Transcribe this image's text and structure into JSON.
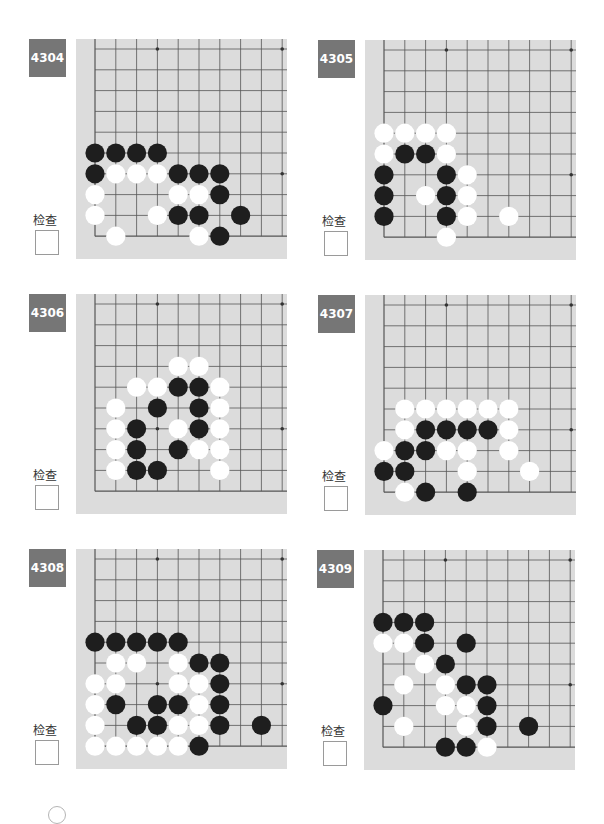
{
  "check_label": "检查",
  "colors": {
    "badge": "#767676",
    "board": "#dcdcdc",
    "line": "#555555",
    "black": "#1e1e1e",
    "white": "#ffffff"
  },
  "problems": [
    {
      "id": "4304",
      "label": "4304",
      "pos": [
        29,
        39
      ],
      "star_points": [
        [
          3,
          0
        ],
        [
          9,
          0
        ],
        [
          9,
          6
        ]
      ],
      "stones": [
        [
          0,
          5,
          "B"
        ],
        [
          1,
          5,
          "B"
        ],
        [
          2,
          5,
          "B"
        ],
        [
          3,
          5,
          "B"
        ],
        [
          0,
          6,
          "B"
        ],
        [
          1,
          6,
          "W"
        ],
        [
          2,
          6,
          "W"
        ],
        [
          3,
          6,
          "W"
        ],
        [
          4,
          6,
          "B"
        ],
        [
          5,
          6,
          "B"
        ],
        [
          6,
          6,
          "B"
        ],
        [
          0,
          7,
          "W"
        ],
        [
          4,
          7,
          "W"
        ],
        [
          5,
          7,
          "W"
        ],
        [
          6,
          7,
          "B"
        ],
        [
          0,
          8,
          "W"
        ],
        [
          3,
          8,
          "W"
        ],
        [
          4,
          8,
          "B"
        ],
        [
          5,
          8,
          "B"
        ],
        [
          7,
          8,
          "B"
        ],
        [
          1,
          9,
          "W"
        ],
        [
          5,
          9,
          "W"
        ],
        [
          6,
          9,
          "B"
        ]
      ]
    },
    {
      "id": "4305",
      "label": "4305",
      "pos": [
        318,
        40
      ],
      "star_points": [
        [
          3,
          0
        ],
        [
          9,
          0
        ],
        [
          9,
          6
        ]
      ],
      "stones": [
        [
          0,
          4,
          "W"
        ],
        [
          1,
          4,
          "W"
        ],
        [
          2,
          4,
          "W"
        ],
        [
          3,
          4,
          "W"
        ],
        [
          0,
          5,
          "W"
        ],
        [
          1,
          5,
          "B"
        ],
        [
          2,
          5,
          "B"
        ],
        [
          3,
          5,
          "W"
        ],
        [
          0,
          6,
          "B"
        ],
        [
          3,
          6,
          "B"
        ],
        [
          4,
          6,
          "W"
        ],
        [
          0,
          7,
          "B"
        ],
        [
          2,
          7,
          "W"
        ],
        [
          3,
          7,
          "B"
        ],
        [
          4,
          7,
          "W"
        ],
        [
          0,
          8,
          "B"
        ],
        [
          3,
          8,
          "B"
        ],
        [
          4,
          8,
          "W"
        ],
        [
          6,
          8,
          "W"
        ],
        [
          3,
          9,
          "W"
        ]
      ]
    },
    {
      "id": "4306",
      "label": "4306",
      "pos": [
        29,
        294
      ],
      "star_points": [
        [
          3,
          0
        ],
        [
          9,
          0
        ],
        [
          3,
          6
        ],
        [
          9,
          6
        ]
      ],
      "stones": [
        [
          4,
          3,
          "W"
        ],
        [
          5,
          3,
          "W"
        ],
        [
          2,
          4,
          "W"
        ],
        [
          3,
          4,
          "W"
        ],
        [
          4,
          4,
          "B"
        ],
        [
          5,
          4,
          "B"
        ],
        [
          6,
          4,
          "W"
        ],
        [
          1,
          5,
          "W"
        ],
        [
          3,
          5,
          "B"
        ],
        [
          5,
          5,
          "B"
        ],
        [
          6,
          5,
          "W"
        ],
        [
          1,
          6,
          "W"
        ],
        [
          2,
          6,
          "B"
        ],
        [
          4,
          6,
          "W"
        ],
        [
          5,
          6,
          "B"
        ],
        [
          6,
          6,
          "W"
        ],
        [
          1,
          7,
          "W"
        ],
        [
          2,
          7,
          "B"
        ],
        [
          4,
          7,
          "B"
        ],
        [
          5,
          7,
          "W"
        ],
        [
          6,
          7,
          "W"
        ],
        [
          1,
          8,
          "W"
        ],
        [
          2,
          8,
          "B"
        ],
        [
          3,
          8,
          "B"
        ],
        [
          6,
          8,
          "W"
        ]
      ]
    },
    {
      "id": "4307",
      "label": "4307",
      "pos": [
        318,
        295
      ],
      "star_points": [
        [
          3,
          0
        ],
        [
          9,
          0
        ],
        [
          9,
          6
        ]
      ],
      "stones": [
        [
          1,
          5,
          "W"
        ],
        [
          2,
          5,
          "W"
        ],
        [
          3,
          5,
          "W"
        ],
        [
          4,
          5,
          "W"
        ],
        [
          5,
          5,
          "W"
        ],
        [
          6,
          5,
          "W"
        ],
        [
          1,
          6,
          "W"
        ],
        [
          2,
          6,
          "B"
        ],
        [
          3,
          6,
          "B"
        ],
        [
          4,
          6,
          "B"
        ],
        [
          5,
          6,
          "B"
        ],
        [
          6,
          6,
          "W"
        ],
        [
          0,
          7,
          "W"
        ],
        [
          1,
          7,
          "B"
        ],
        [
          2,
          7,
          "B"
        ],
        [
          3,
          7,
          "W"
        ],
        [
          4,
          7,
          "W"
        ],
        [
          6,
          7,
          "W"
        ],
        [
          0,
          8,
          "B"
        ],
        [
          1,
          8,
          "B"
        ],
        [
          4,
          8,
          "W"
        ],
        [
          7,
          8,
          "W"
        ],
        [
          1,
          9,
          "W"
        ],
        [
          2,
          9,
          "B"
        ],
        [
          4,
          9,
          "B"
        ]
      ]
    },
    {
      "id": "4308",
      "label": "4308",
      "pos": [
        29,
        549
      ],
      "star_points": [
        [
          3,
          0
        ],
        [
          9,
          0
        ],
        [
          3,
          6
        ],
        [
          9,
          6
        ]
      ],
      "stones": [
        [
          0,
          4,
          "B"
        ],
        [
          1,
          4,
          "B"
        ],
        [
          2,
          4,
          "B"
        ],
        [
          3,
          4,
          "B"
        ],
        [
          4,
          4,
          "B"
        ],
        [
          1,
          5,
          "W"
        ],
        [
          2,
          5,
          "W"
        ],
        [
          4,
          5,
          "W"
        ],
        [
          5,
          5,
          "B"
        ],
        [
          6,
          5,
          "B"
        ],
        [
          0,
          6,
          "W"
        ],
        [
          1,
          6,
          "W"
        ],
        [
          4,
          6,
          "W"
        ],
        [
          5,
          6,
          "W"
        ],
        [
          6,
          6,
          "B"
        ],
        [
          0,
          7,
          "W"
        ],
        [
          1,
          7,
          "B"
        ],
        [
          3,
          7,
          "B"
        ],
        [
          4,
          7,
          "B"
        ],
        [
          5,
          7,
          "W"
        ],
        [
          6,
          7,
          "B"
        ],
        [
          0,
          8,
          "W"
        ],
        [
          2,
          8,
          "B"
        ],
        [
          3,
          8,
          "B"
        ],
        [
          4,
          8,
          "W"
        ],
        [
          5,
          8,
          "W"
        ],
        [
          6,
          8,
          "B"
        ],
        [
          8,
          8,
          "B"
        ],
        [
          0,
          9,
          "W"
        ],
        [
          1,
          9,
          "W"
        ],
        [
          2,
          9,
          "W"
        ],
        [
          3,
          9,
          "W"
        ],
        [
          4,
          9,
          "W"
        ],
        [
          5,
          9,
          "B"
        ]
      ]
    },
    {
      "id": "4309",
      "label": "4309",
      "pos": [
        317,
        550
      ],
      "star_points": [
        [
          3,
          0
        ],
        [
          9,
          0
        ],
        [
          9,
          6
        ]
      ],
      "stones": [
        [
          0,
          3,
          "B"
        ],
        [
          1,
          3,
          "B"
        ],
        [
          2,
          3,
          "B"
        ],
        [
          0,
          4,
          "W"
        ],
        [
          1,
          4,
          "W"
        ],
        [
          2,
          4,
          "B"
        ],
        [
          4,
          4,
          "B"
        ],
        [
          2,
          5,
          "W"
        ],
        [
          3,
          5,
          "B"
        ],
        [
          1,
          6,
          "W"
        ],
        [
          3,
          6,
          "W"
        ],
        [
          4,
          6,
          "B"
        ],
        [
          5,
          6,
          "B"
        ],
        [
          0,
          7,
          "B"
        ],
        [
          3,
          7,
          "W"
        ],
        [
          4,
          7,
          "W"
        ],
        [
          5,
          7,
          "B"
        ],
        [
          1,
          8,
          "W"
        ],
        [
          4,
          8,
          "W"
        ],
        [
          5,
          8,
          "B"
        ],
        [
          7,
          8,
          "B"
        ],
        [
          3,
          9,
          "B"
        ],
        [
          4,
          9,
          "B"
        ],
        [
          5,
          9,
          "W"
        ]
      ]
    }
  ]
}
